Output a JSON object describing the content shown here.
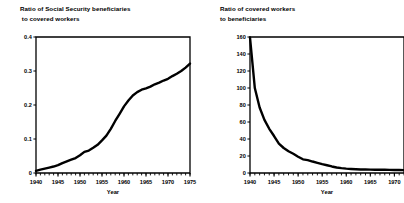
{
  "figure": {
    "background": "#ffffff",
    "ink": "#000000"
  },
  "panels": [
    {
      "id": "left",
      "title_line1": "Ratio of Social Security beneficiaries",
      "title_line2": " to covered workers",
      "xlabel": "Year"
    },
    {
      "id": "right",
      "title_line1": "Ratio of covered workers",
      "title_line2": "to beneficiaries",
      "xlabel": "Year"
    }
  ],
  "chart_data": [
    {
      "type": "line",
      "title": "Ratio of Social Security beneficiaries to covered workers",
      "xlabel": "Year",
      "ylabel": "",
      "xlim": [
        1940,
        1975
      ],
      "ylim": [
        0,
        0.4
      ],
      "xticks": [
        1940,
        1945,
        1950,
        1955,
        1960,
        1965,
        1970,
        1975
      ],
      "xticklabels": [
        "1940",
        "1945",
        "1950",
        "1955",
        "1960",
        "1965",
        "1970",
        "1975"
      ],
      "yticks": [
        0,
        0.1,
        0.2,
        0.3,
        0.4
      ],
      "yticklabels": [
        "0",
        "0.1",
        "0.2",
        "0.3",
        "0.4"
      ],
      "minor_xtick_interval": 1,
      "grid": false,
      "legend": false,
      "series": [
        {
          "name": "beneficiaries per covered worker",
          "x": [
            1940,
            1941,
            1942,
            1943,
            1944,
            1945,
            1946,
            1947,
            1948,
            1949,
            1950,
            1951,
            1952,
            1953,
            1954,
            1955,
            1956,
            1957,
            1958,
            1959,
            1960,
            1961,
            1962,
            1963,
            1964,
            1965,
            1966,
            1967,
            1968,
            1969,
            1970,
            1971,
            1972,
            1973,
            1974,
            1975
          ],
          "values": [
            0.006,
            0.01,
            0.013,
            0.016,
            0.019,
            0.023,
            0.029,
            0.034,
            0.039,
            0.044,
            0.052,
            0.062,
            0.066,
            0.074,
            0.083,
            0.096,
            0.11,
            0.13,
            0.153,
            0.174,
            0.196,
            0.213,
            0.228,
            0.238,
            0.245,
            0.249,
            0.254,
            0.261,
            0.266,
            0.272,
            0.277,
            0.285,
            0.292,
            0.3,
            0.31,
            0.322
          ]
        }
      ]
    },
    {
      "type": "line",
      "title": "Ratio of covered workers to beneficiaries",
      "xlabel": "Year",
      "ylabel": "",
      "xlim": [
        1940,
        1972
      ],
      "ylim": [
        0,
        160
      ],
      "xticks": [
        1940,
        1945,
        1950,
        1955,
        1960,
        1965,
        1970
      ],
      "xticklabels": [
        "1940",
        "1945",
        "1950",
        "1955",
        "1960",
        "1965",
        "1970"
      ],
      "yticks": [
        0,
        20,
        40,
        60,
        80,
        100,
        120,
        140,
        160
      ],
      "yticklabels": [
        "0",
        "20",
        "40",
        "60",
        "80",
        "100",
        "120",
        "140",
        "160"
      ],
      "minor_xtick_interval": 1,
      "grid": false,
      "legend": false,
      "series": [
        {
          "name": "covered workers per beneficiary",
          "x": [
            1940,
            1941,
            1942,
            1943,
            1944,
            1945,
            1946,
            1947,
            1948,
            1949,
            1950,
            1951,
            1952,
            1953,
            1954,
            1955,
            1956,
            1957,
            1958,
            1959,
            1960,
            1961,
            1962,
            1963,
            1964,
            1965,
            1966,
            1967,
            1968,
            1969,
            1970,
            1971,
            1972
          ],
          "values": [
            159.4,
            100.0,
            77.0,
            62.5,
            52.0,
            43.5,
            34.5,
            29.4,
            25.6,
            22.7,
            19.2,
            16.1,
            15.2,
            13.5,
            12.0,
            10.4,
            9.1,
            7.7,
            6.5,
            5.7,
            5.1,
            4.7,
            4.4,
            4.2,
            4.1,
            4.0,
            3.9,
            3.8,
            3.8,
            3.7,
            3.6,
            3.5,
            3.4
          ]
        }
      ]
    }
  ]
}
